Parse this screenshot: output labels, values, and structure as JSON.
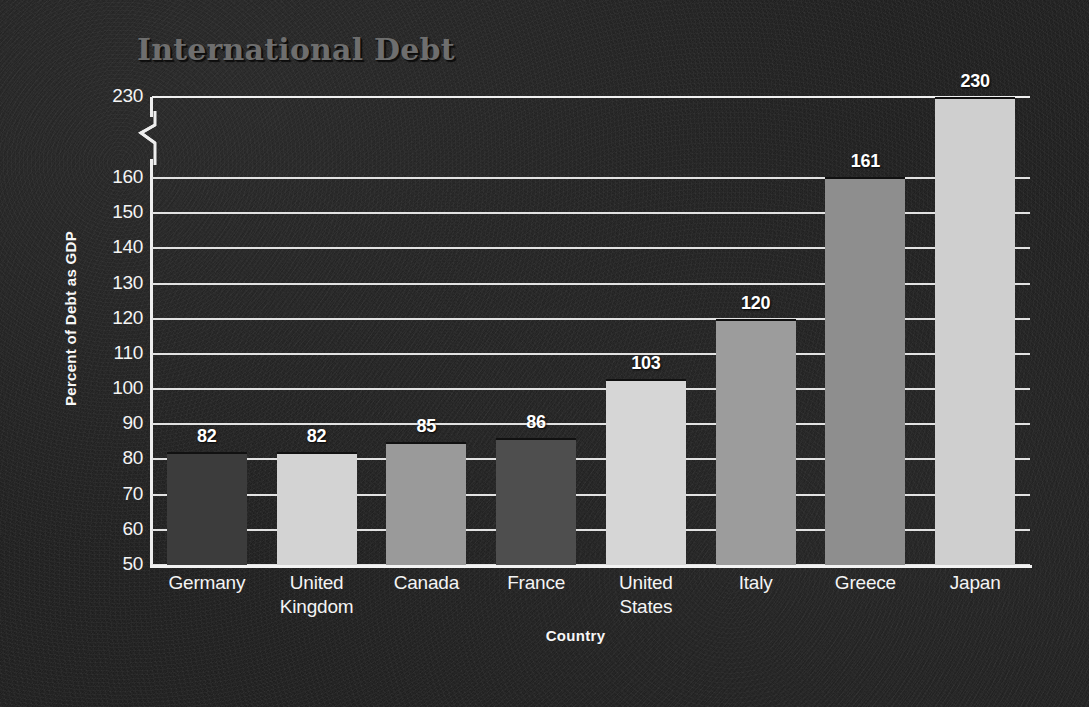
{
  "chart_data": {
    "type": "bar",
    "title": "International Debt",
    "xlabel": "Country",
    "ylabel": "Percent of Debt as GDP",
    "categories": [
      "Germany",
      "United Kingdom",
      "Canada",
      "France",
      "United States",
      "Italy",
      "Greece",
      "Japan"
    ],
    "values": [
      82,
      82,
      85,
      86,
      103,
      120,
      161,
      230
    ],
    "value_labels": [
      "82",
      "82",
      "85",
      "86",
      "103",
      "120",
      "161",
      "230"
    ],
    "ytick_labels": [
      "230",
      "160",
      "150",
      "140",
      "130",
      "120",
      "110",
      "100",
      "90",
      "80",
      "70",
      "60",
      "50"
    ],
    "ytick_values": [
      230,
      160,
      150,
      140,
      130,
      120,
      110,
      100,
      90,
      80,
      70,
      60,
      50
    ],
    "ylim": [
      50,
      230
    ],
    "axis_break": true,
    "axis_break_between": [
      160,
      230
    ],
    "grid": true,
    "legend": "none",
    "bar_colors": [
      "#3c3c3c",
      "#d3d3d3",
      "#9a9a9a",
      "#4e4e4e",
      "#d6d6d6",
      "#9c9c9c",
      "#8e8e8e",
      "#cfcfcf"
    ],
    "background_color": "#222222",
    "grid_color": "#e2e2e2",
    "text_color": "#f4f4f4",
    "title_color": "#6e6e6e"
  },
  "axis": {
    "y_title": "Percent of Debt as GDP",
    "x_title": "Country"
  }
}
